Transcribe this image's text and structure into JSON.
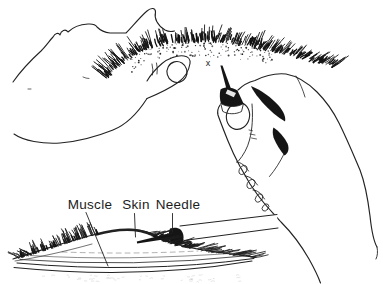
{
  "figure": {
    "labels": {
      "muscle": "Muscle",
      "skin": "Skin",
      "needle": "Needle"
    },
    "injection_site_marker": "x",
    "colors": {
      "ink": "#1c1c1c",
      "paper": "#ffffff"
    }
  }
}
